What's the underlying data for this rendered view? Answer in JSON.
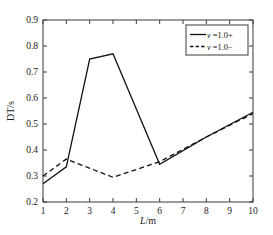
{
  "chart_data": {
    "type": "line",
    "title": "",
    "xlabel": "L/m",
    "ylabel": "DT/s",
    "xlim": [
      1,
      10
    ],
    "ylim": [
      0.2,
      0.9
    ],
    "grid": false,
    "legend_position": "top-right",
    "x_ticks": [
      "1",
      "2",
      "3",
      "4",
      "5",
      "6",
      "7",
      "8",
      "9",
      "10"
    ],
    "x_tick_values": [
      1,
      2,
      3,
      4,
      5,
      6,
      7,
      8,
      9,
      10
    ],
    "y_ticks": [
      "0.2",
      "0.3",
      "0.4",
      "0.5",
      "0.6",
      "0.7",
      "0.8",
      "0.9"
    ],
    "y_tick_values": [
      0.2,
      0.3,
      0.4,
      0.5,
      0.6,
      0.7,
      0.8,
      0.9
    ],
    "series": [
      {
        "name": "v =1.0+",
        "style": "solid",
        "color": "#111111",
        "x": [
          1,
          2,
          3,
          4,
          6,
          8,
          10
        ],
        "values": [
          0.27,
          0.335,
          0.75,
          0.77,
          0.345,
          0.45,
          0.545
        ]
      },
      {
        "name": "v =1.0-",
        "style": "dashed",
        "color": "#111111",
        "x": [
          1,
          2,
          4,
          6,
          8,
          10
        ],
        "values": [
          0.3,
          0.365,
          0.295,
          0.355,
          0.45,
          0.54
        ]
      }
    ]
  },
  "axes": {
    "x_label_prefix": "L",
    "x_label_suffix": "/m",
    "y_label": "DT/s"
  },
  "legend": {
    "entries": [
      {
        "prefix": "v",
        "text": " =1.0+"
      },
      {
        "prefix": "v",
        "text": " =1.0−"
      }
    ]
  }
}
